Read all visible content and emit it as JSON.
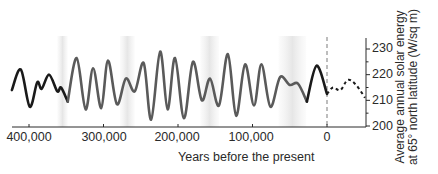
{
  "chart_data": {
    "type": "line",
    "title": "",
    "xlabel": "Years before the present",
    "ylabel": "Average annual solar energy at 65° north latitude (W/sq m)",
    "ylabel_lines": [
      "Average annual solar energy",
      "at 65° north latitude (W/sq m)"
    ],
    "x_ticks": [
      "400,000",
      "300,000",
      "200,000",
      "100,000",
      "0"
    ],
    "x_tick_values": [
      400000,
      300000,
      200000,
      100000,
      0
    ],
    "y_ticks": [
      "230",
      "220",
      "210",
      "200"
    ],
    "y_tick_values": [
      230,
      220,
      210,
      200
    ],
    "xlim": [
      423000,
      -52000
    ],
    "ylim": [
      199,
      232
    ],
    "grid": false,
    "legend": null,
    "reference_line": {
      "x": 0,
      "style": "dashed",
      "color": "#999999"
    },
    "series": [
      {
        "name": "Past insolation (early, black)",
        "style": "solid",
        "color": "#1a1a1a",
        "x": [
          423000,
          411000,
          399000,
          389000,
          383000,
          373000,
          362000,
          357000,
          348000
        ],
        "y": [
          214,
          222,
          207.5,
          217,
          214.5,
          220,
          213.5,
          215,
          209.5
        ]
      },
      {
        "name": "Past insolation (gray)",
        "style": "solid",
        "color": "#5a5a5a",
        "x": [
          348000,
          336000,
          324000,
          314000,
          303000,
          294000,
          282000,
          270000,
          258000,
          246000,
          236000,
          224000,
          214000,
          204000,
          192000,
          180000,
          168000,
          157000,
          145000,
          133000,
          122000,
          110000,
          98000,
          88000,
          76000,
          63000,
          50000,
          39000,
          27000
        ],
        "y": [
          209.5,
          226.5,
          206.5,
          222.5,
          207,
          225.5,
          208.5,
          218.5,
          213.5,
          224.5,
          202.5,
          229,
          206.5,
          226.5,
          203,
          225,
          210,
          218.5,
          208,
          228,
          204,
          224,
          208,
          224,
          207.5,
          219,
          216,
          216.5,
          209.5
        ]
      },
      {
        "name": "Recent insolation (black)",
        "style": "solid",
        "color": "#1a1a1a",
        "x": [
          27000,
          14000,
          0
        ],
        "y": [
          209.5,
          223.5,
          212.5
        ]
      },
      {
        "name": "Future projection",
        "style": "dashed",
        "color": "#1a1a1a",
        "x": [
          0,
          -8000,
          -18000,
          -28000,
          -39000,
          -51000
        ],
        "y": [
          212.5,
          215,
          214,
          218,
          216,
          211
        ]
      }
    ],
    "shaded_bands_x": [
      [
        362000,
        348000
      ],
      [
        278000,
        258000
      ],
      [
        170000,
        145000
      ],
      [
        65000,
        28000
      ]
    ]
  },
  "labels": {
    "x_ticks": [
      "400,000",
      "300,000",
      "200,000",
      "100,000",
      "0"
    ],
    "y_ticks": [
      "230",
      "220",
      "210",
      "200"
    ],
    "xlabel": "Years before the present",
    "ylabel_1": "Average annual solar energy",
    "ylabel_2": "at 65° north latitude (W/sq m)"
  },
  "colors": {
    "axis": "#2a2a2a",
    "band": "#ececec",
    "zero_line": "#9a9a9a"
  }
}
